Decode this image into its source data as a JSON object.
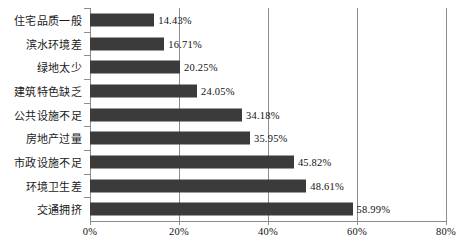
{
  "chart_data": {
    "type": "bar",
    "orientation": "horizontal",
    "title": "",
    "subtitle": "",
    "xlabel": "",
    "ylabel": "",
    "xlim": [
      0,
      80
    ],
    "grid": true,
    "legend": false,
    "xticks": [
      "0%",
      "20%",
      "40%",
      "60%",
      "80%"
    ],
    "xtick_values": [
      0,
      20,
      40,
      60,
      80
    ],
    "categories": [
      "住宅品质一般",
      "滨水环境差",
      "绿地太少",
      "建筑特色缺乏",
      "公共设施不足",
      "房地产过量",
      "市政设施不足",
      "环境卫生差",
      "交通拥挤"
    ],
    "values": [
      14.43,
      16.71,
      20.25,
      24.05,
      34.18,
      35.95,
      45.82,
      48.61,
      58.99
    ],
    "value_labels": [
      "14.43%",
      "16.71%",
      "20.25%",
      "24.05%",
      "34.18%",
      "35.95%",
      "45.82%",
      "48.61%",
      "58.99%"
    ],
    "bar_color": "#3b3b3b",
    "axis_color": "#8c8c8c",
    "background_color": "#ffffff"
  }
}
